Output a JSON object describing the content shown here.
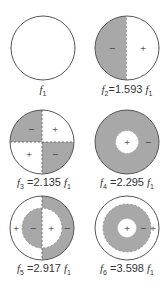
{
  "colors": {
    "shade": "#a8a8a8",
    "outline": "#555555",
    "background": "#ffffff"
  },
  "modes": [
    {
      "id": "f1",
      "symbol": "f",
      "sub": "1",
      "ratio": "",
      "label": "f1",
      "signs": []
    },
    {
      "id": "f2",
      "symbol": "f",
      "sub": "2",
      "ratio": "1.593",
      "label": "f2 = 1.593 f1",
      "signs": [
        "−",
        "+"
      ]
    },
    {
      "id": "f3",
      "symbol": "f",
      "sub": "3",
      "ratio": "2.135",
      "label": "f3 = 2.135 f1",
      "signs": [
        "−",
        "+",
        "+",
        "−"
      ]
    },
    {
      "id": "f4",
      "symbol": "f",
      "sub": "4",
      "ratio": "2.295",
      "label": "f4 = 2.295 f1",
      "signs": [
        "+",
        "−"
      ]
    },
    {
      "id": "f5",
      "symbol": "f",
      "sub": "5",
      "ratio": "2.917",
      "label": "f5 = 2.917 f1",
      "signs": [
        "+",
        "−",
        "+",
        "−"
      ]
    },
    {
      "id": "f6",
      "symbol": "f",
      "sub": "6",
      "ratio": "3.598",
      "label": "f6 = 3.598 f1",
      "signs": [
        "+",
        "−",
        "+"
      ]
    }
  ],
  "label_parts": {
    "eq": "=",
    "base_symbol": "f",
    "base_sub": "1"
  }
}
